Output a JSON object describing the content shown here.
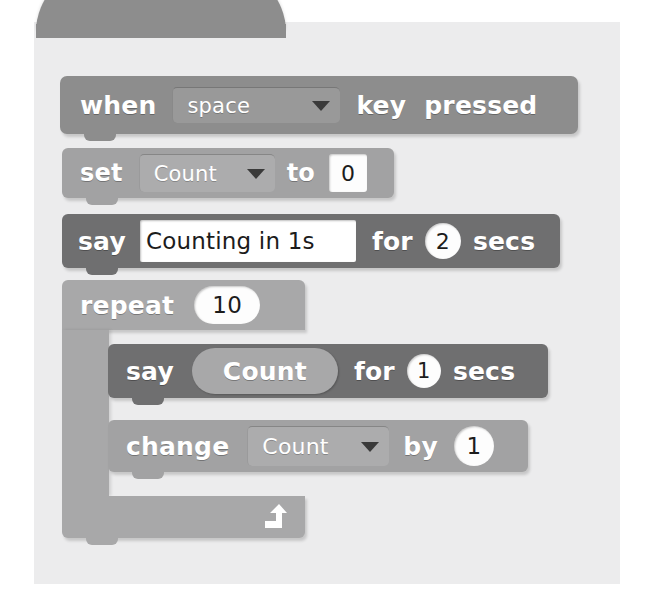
{
  "app": {
    "title": "Scratch script — counting with a variable",
    "background_color": "#ececed"
  },
  "palette": {
    "hat_block_color": "#8d8d8d",
    "variables_block_color": "#a2a2a3",
    "looks_block_color": "#6f6f70",
    "control_block_color": "#a8a8a9",
    "input_field_color": "#ffffff",
    "text_color": "#ffffff"
  },
  "script": {
    "blocks": [
      {
        "id": "when-key-pressed",
        "category": "events",
        "shape": "hat",
        "label_before": "when",
        "dropdown_value": "space",
        "label_middle": "key",
        "label_after": "pressed"
      },
      {
        "id": "set-variable",
        "category": "variables",
        "shape": "stack",
        "label_before": "set",
        "dropdown_value": "Count",
        "label_middle": "to",
        "value": "0"
      },
      {
        "id": "say-for-secs-outer",
        "category": "looks",
        "shape": "stack",
        "label_before": "say",
        "message": "Counting in 1s",
        "label_middle": "for",
        "seconds": "2",
        "label_after": "secs"
      },
      {
        "id": "repeat-loop",
        "category": "control",
        "shape": "c-block",
        "label_before": "repeat",
        "times": "10",
        "loop_arrow": "loop-arrow-icon",
        "children": [
          {
            "id": "say-for-secs-inner",
            "category": "looks",
            "shape": "stack",
            "label_before": "say",
            "reporter": "Count",
            "label_middle": "for",
            "seconds": "1",
            "label_after": "secs"
          },
          {
            "id": "change-variable",
            "category": "variables",
            "shape": "stack",
            "label_before": "change",
            "dropdown_value": "Count",
            "label_middle": "by",
            "value": "1"
          }
        ]
      }
    ]
  }
}
